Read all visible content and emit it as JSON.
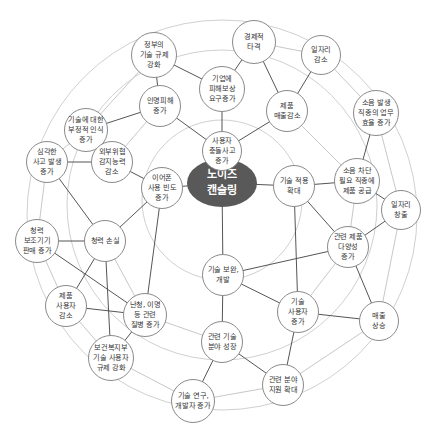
{
  "diagram": {
    "type": "futures-wheel",
    "colors": {
      "center_fill": "#595959",
      "center_text": "#ffffff",
      "node_border": "#8a8a8a",
      "ring_line": "#d0d0d0",
      "link_strong": "#555555",
      "link_light": "#c8c8c8"
    },
    "center": {
      "id": "c",
      "label": "노이즈\n캔슬링",
      "x": 222,
      "y": 183,
      "rx": 35,
      "ry": 24
    },
    "rings": [
      {
        "cx": 222,
        "cy": 200,
        "r": 80
      },
      {
        "cx": 222,
        "cy": 205,
        "r": 155
      },
      {
        "cx": 222,
        "cy": 215,
        "r": 195
      }
    ],
    "nodes": [
      {
        "id": "n1",
        "label": "경제적\n타격",
        "x": 254,
        "y": 42,
        "r": 22
      },
      {
        "id": "n2",
        "label": "정부의\n기술 규제\n강화",
        "x": 154,
        "y": 55,
        "r": 23
      },
      {
        "id": "n3",
        "label": "일자리\n감소",
        "x": 321,
        "y": 55,
        "r": 20
      },
      {
        "id": "n4",
        "label": "기업에\n피해보상\n요구증가",
        "x": 222,
        "y": 89,
        "r": 23
      },
      {
        "id": "n5",
        "label": "인명피해\n증가",
        "x": 160,
        "y": 106,
        "r": 21
      },
      {
        "id": "n6",
        "label": "기술에 대한\n부정적 인식\n증가",
        "x": 86,
        "y": 130,
        "r": 22
      },
      {
        "id": "n7",
        "label": "제품\n매출감소",
        "x": 287,
        "y": 111,
        "r": 21
      },
      {
        "id": "n8",
        "label": "사용자\n충돌사고\n증가",
        "x": 222,
        "y": 151,
        "r": 20
      },
      {
        "id": "n9",
        "label": "소음 발생\n직종의 업무\n효율 증가",
        "x": 376,
        "y": 113,
        "r": 23
      },
      {
        "id": "n10",
        "label": "외부위협\n감지능력\n감소",
        "x": 112,
        "y": 162,
        "r": 21
      },
      {
        "id": "n11",
        "label": "심각한\n사고 발생\n증가",
        "x": 47,
        "y": 162,
        "r": 21
      },
      {
        "id": "n12",
        "label": "이어폰\n사용 빈도\n증가",
        "x": 162,
        "y": 188,
        "r": 21
      },
      {
        "id": "n13",
        "label": "소음 차단\n필요 직종에\n제품 공급",
        "x": 357,
        "y": 181,
        "r": 23
      },
      {
        "id": "n14",
        "label": "기술 적용\n확대",
        "x": 294,
        "y": 186,
        "r": 21
      },
      {
        "id": "n15",
        "label": "일자리\n창출",
        "x": 401,
        "y": 210,
        "r": 20
      },
      {
        "id": "n16",
        "label": "청력\n보조기기\n판매 증가",
        "x": 37,
        "y": 241,
        "r": 22
      },
      {
        "id": "n17",
        "label": "청력 손실",
        "x": 105,
        "y": 241,
        "r": 21
      },
      {
        "id": "n18",
        "label": "관련 제품\n다양성\n증가",
        "x": 348,
        "y": 247,
        "r": 21
      },
      {
        "id": "n19",
        "label": "기술 보완,\n개발",
        "x": 223,
        "y": 275,
        "r": 21
      },
      {
        "id": "n20",
        "label": "제품\n사용자\n감소",
        "x": 66,
        "y": 306,
        "r": 21
      },
      {
        "id": "n21",
        "label": "난청, 이명\n등 관련\n질병 증가",
        "x": 145,
        "y": 315,
        "r": 22
      },
      {
        "id": "n22",
        "label": "기술\n사용자\n증가",
        "x": 298,
        "y": 312,
        "r": 21
      },
      {
        "id": "n23",
        "label": "매출\n상승",
        "x": 379,
        "y": 321,
        "r": 20
      },
      {
        "id": "n24",
        "label": "보건복지부\n기술 사용자\n규제 강화",
        "x": 111,
        "y": 358,
        "r": 23
      },
      {
        "id": "n25",
        "label": "관련 기술\n분야 성장",
        "x": 222,
        "y": 342,
        "r": 21
      },
      {
        "id": "n26",
        "label": "기술 연구,\n개발자 증가",
        "x": 193,
        "y": 401,
        "r": 22
      },
      {
        "id": "n27",
        "label": "관련 분야\n지원 확대",
        "x": 283,
        "y": 385,
        "r": 21
      }
    ],
    "links_strong": [
      [
        "c",
        "n8"
      ],
      [
        "c",
        "n12"
      ],
      [
        "c",
        "n14"
      ],
      [
        "c",
        "n19"
      ],
      [
        "n8",
        "n4"
      ],
      [
        "n8",
        "n5"
      ],
      [
        "n8",
        "n7"
      ],
      [
        "n4",
        "n1"
      ],
      [
        "n4",
        "n2"
      ],
      [
        "n1",
        "n7"
      ],
      [
        "n7",
        "n3"
      ],
      [
        "n2",
        "n5"
      ],
      [
        "n5",
        "n6"
      ],
      [
        "n6",
        "n10"
      ],
      [
        "n10",
        "n11"
      ],
      [
        "n10",
        "n12"
      ],
      [
        "n12",
        "n17"
      ],
      [
        "n12",
        "n21"
      ],
      [
        "n17",
        "n16"
      ],
      [
        "n17",
        "n20"
      ],
      [
        "n17",
        "n24"
      ],
      [
        "n16",
        "n21"
      ],
      [
        "n20",
        "n21"
      ],
      [
        "n21",
        "n24"
      ],
      [
        "n11",
        "n17"
      ],
      [
        "n14",
        "n13"
      ],
      [
        "n14",
        "n18"
      ],
      [
        "n14",
        "n22"
      ],
      [
        "n13",
        "n9"
      ],
      [
        "n13",
        "n15"
      ],
      [
        "n18",
        "n15"
      ],
      [
        "n18",
        "n23"
      ],
      [
        "n18",
        "n19"
      ],
      [
        "n19",
        "n22"
      ],
      [
        "n19",
        "n25"
      ],
      [
        "n22",
        "n23"
      ],
      [
        "n22",
        "n27"
      ],
      [
        "n25",
        "n26"
      ],
      [
        "n25",
        "n27"
      ]
    ],
    "links_light": [
      [
        "n2",
        "n6"
      ],
      [
        "n6",
        "n11"
      ],
      [
        "n11",
        "n16"
      ],
      [
        "n16",
        "n20"
      ],
      [
        "n20",
        "n24"
      ],
      [
        "n24",
        "n26"
      ],
      [
        "n26",
        "n27"
      ],
      [
        "n1",
        "n3"
      ],
      [
        "n3",
        "n9"
      ],
      [
        "n9",
        "n15"
      ],
      [
        "n15",
        "n23"
      ],
      [
        "n23",
        "n27"
      ],
      [
        "n7",
        "n13"
      ],
      [
        "n13",
        "n18"
      ],
      [
        "n18",
        "n22"
      ],
      [
        "n21",
        "n25"
      ],
      [
        "n5",
        "n10"
      ],
      [
        "n17",
        "n21"
      ]
    ]
  },
  "caption": {
    "text": ""
  }
}
